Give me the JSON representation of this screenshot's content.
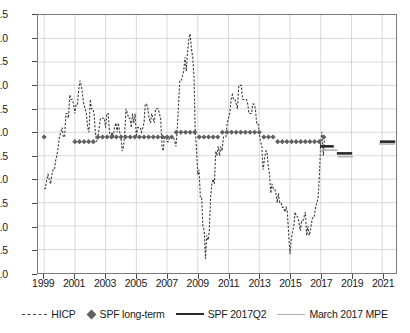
{
  "chart_data": {
    "type": "line",
    "title": "",
    "xlabel": "",
    "ylabel": "",
    "xlim": [
      1998.6,
      2021.9
    ],
    "ylim": [
      -1.0,
      4.5
    ],
    "grid": true,
    "legend_position": "bottom",
    "ytick_labels": [
      "4.5",
      "4.0",
      "3.5",
      "3.0",
      "2.5",
      "2.0",
      "1.5",
      "1.0",
      "0.5",
      "0.0",
      "-0.5",
      "-1.0"
    ],
    "ytick_values": [
      4.5,
      4.0,
      3.5,
      3.0,
      2.5,
      2.0,
      1.5,
      1.0,
      0.5,
      0.0,
      -0.5,
      -1.0
    ],
    "xtick_labels": [
      "1999",
      "2001",
      "2003",
      "2005",
      "2007",
      "2009",
      "2011",
      "2013",
      "2015",
      "2017",
      "2019",
      "2021"
    ],
    "xtick_values": [
      1999,
      2001,
      2003,
      2005,
      2007,
      2009,
      2011,
      2013,
      2015,
      2017,
      2019,
      2021
    ],
    "series": [
      {
        "name": "HICP",
        "style": "dashed-line",
        "color": "#3c3c3c",
        "x": [
          1999.0,
          1999.08,
          1999.17,
          1999.25,
          1999.33,
          1999.42,
          1999.5,
          1999.58,
          1999.67,
          1999.75,
          1999.83,
          1999.92,
          2000.0,
          2000.08,
          2000.17,
          2000.25,
          2000.33,
          2000.42,
          2000.5,
          2000.58,
          2000.67,
          2000.75,
          2000.83,
          2000.92,
          2001.0,
          2001.08,
          2001.17,
          2001.25,
          2001.33,
          2001.42,
          2001.5,
          2001.58,
          2001.67,
          2001.75,
          2001.83,
          2001.92,
          2002.0,
          2002.08,
          2002.17,
          2002.25,
          2002.33,
          2002.42,
          2002.5,
          2002.58,
          2002.67,
          2002.75,
          2002.83,
          2002.92,
          2003.0,
          2003.08,
          2003.17,
          2003.25,
          2003.33,
          2003.42,
          2003.5,
          2003.58,
          2003.67,
          2003.75,
          2003.83,
          2003.92,
          2004.0,
          2004.08,
          2004.17,
          2004.25,
          2004.33,
          2004.42,
          2004.5,
          2004.58,
          2004.67,
          2004.75,
          2004.83,
          2004.92,
          2005.0,
          2005.08,
          2005.17,
          2005.25,
          2005.33,
          2005.42,
          2005.5,
          2005.58,
          2005.67,
          2005.75,
          2005.83,
          2005.92,
          2006.0,
          2006.08,
          2006.17,
          2006.25,
          2006.33,
          2006.42,
          2006.5,
          2006.58,
          2006.67,
          2006.75,
          2006.83,
          2006.92,
          2007.0,
          2007.08,
          2007.17,
          2007.25,
          2007.33,
          2007.42,
          2007.5,
          2007.58,
          2007.67,
          2007.75,
          2007.83,
          2007.92,
          2008.0,
          2008.08,
          2008.17,
          2008.25,
          2008.33,
          2008.42,
          2008.5,
          2008.58,
          2008.67,
          2008.75,
          2008.83,
          2008.92,
          2009.0,
          2009.08,
          2009.17,
          2009.25,
          2009.33,
          2009.42,
          2009.5,
          2009.58,
          2009.67,
          2009.75,
          2009.83,
          2009.92,
          2010.0,
          2010.08,
          2010.17,
          2010.25,
          2010.33,
          2010.42,
          2010.5,
          2010.58,
          2010.67,
          2010.75,
          2010.83,
          2010.92,
          2011.0,
          2011.08,
          2011.17,
          2011.25,
          2011.33,
          2011.42,
          2011.5,
          2011.58,
          2011.67,
          2011.75,
          2011.83,
          2011.92,
          2012.0,
          2012.08,
          2012.17,
          2012.25,
          2012.33,
          2012.42,
          2012.5,
          2012.58,
          2012.67,
          2012.75,
          2012.83,
          2012.92,
          2013.0,
          2013.08,
          2013.17,
          2013.25,
          2013.33,
          2013.42,
          2013.5,
          2013.58,
          2013.67,
          2013.75,
          2013.83,
          2013.92,
          2014.0,
          2014.08,
          2014.17,
          2014.25,
          2014.33,
          2014.42,
          2014.5,
          2014.58,
          2014.67,
          2014.75,
          2014.83,
          2014.92,
          2015.0,
          2015.08,
          2015.17,
          2015.25,
          2015.33,
          2015.42,
          2015.5,
          2015.58,
          2015.67,
          2015.75,
          2015.83,
          2015.92,
          2016.0,
          2016.08,
          2016.17,
          2016.25,
          2016.33,
          2016.42,
          2016.5,
          2016.58,
          2016.67,
          2016.75,
          2016.83,
          2016.92,
          2017.0,
          2017.08,
          2017.17,
          2017.25
        ],
        "y": [
          0.8,
          0.8,
          1.0,
          1.1,
          1.0,
          0.9,
          1.1,
          1.2,
          1.2,
          1.4,
          1.5,
          1.7,
          1.9,
          2.0,
          2.1,
          1.9,
          1.9,
          2.4,
          2.4,
          2.3,
          2.8,
          2.7,
          2.7,
          2.6,
          2.4,
          2.6,
          2.6,
          2.9,
          3.1,
          3.0,
          2.8,
          2.6,
          2.5,
          2.4,
          2.1,
          2.0,
          2.7,
          2.5,
          2.5,
          2.4,
          2.0,
          1.8,
          1.9,
          2.1,
          2.3,
          2.3,
          2.3,
          2.3,
          2.1,
          2.4,
          2.4,
          2.0,
          1.9,
          2.0,
          1.9,
          2.1,
          2.2,
          2.0,
          2.2,
          2.0,
          1.9,
          1.6,
          1.7,
          2.0,
          2.5,
          2.4,
          2.3,
          2.3,
          2.1,
          2.4,
          2.2,
          2.4,
          1.9,
          2.1,
          2.1,
          2.1,
          2.0,
          2.1,
          2.2,
          2.6,
          2.6,
          2.5,
          2.3,
          2.2,
          2.4,
          2.3,
          2.2,
          2.5,
          2.5,
          2.5,
          2.4,
          2.3,
          1.7,
          1.6,
          1.9,
          1.9,
          1.8,
          1.8,
          1.9,
          1.9,
          1.9,
          1.9,
          1.8,
          1.7,
          2.1,
          2.6,
          3.1,
          3.1,
          3.2,
          3.3,
          3.6,
          3.3,
          3.7,
          4.0,
          4.1,
          3.8,
          3.6,
          3.2,
          2.1,
          1.6,
          1.1,
          1.2,
          0.6,
          0.6,
          0.0,
          -0.1,
          -0.7,
          -0.2,
          -0.3,
          -0.1,
          0.6,
          0.9,
          1.0,
          0.9,
          1.6,
          1.5,
          1.7,
          1.5,
          1.7,
          1.6,
          1.9,
          1.9,
          1.9,
          2.2,
          2.3,
          2.4,
          2.7,
          2.8,
          2.7,
          2.7,
          2.6,
          2.5,
          3.0,
          3.0,
          3.0,
          2.7,
          2.7,
          2.7,
          2.7,
          2.6,
          2.4,
          2.4,
          2.4,
          2.6,
          2.6,
          2.5,
          2.2,
          2.2,
          2.0,
          1.8,
          1.7,
          1.2,
          1.4,
          1.6,
          1.6,
          1.3,
          1.1,
          0.7,
          0.9,
          0.8,
          0.8,
          0.7,
          0.5,
          0.7,
          0.5,
          0.5,
          0.4,
          0.4,
          0.3,
          0.4,
          0.3,
          -0.2,
          -0.6,
          -0.3,
          -0.1,
          0.0,
          0.3,
          0.2,
          0.2,
          0.1,
          -0.1,
          0.1,
          0.1,
          0.2,
          0.3,
          -0.2,
          0.0,
          -0.2,
          -0.1,
          0.1,
          0.2,
          0.2,
          0.4,
          0.5,
          0.6,
          1.1,
          1.8,
          2.0,
          1.5,
          1.9
        ]
      },
      {
        "name": "SPF long-term",
        "style": "diamond-markers",
        "color": "#5f5f5f",
        "x": [
          1999.0,
          2001.0,
          2001.3,
          2001.6,
          2001.9,
          2002.2,
          2002.5,
          2002.8,
          2003.1,
          2003.4,
          2003.7,
          2004.0,
          2004.3,
          2004.6,
          2004.9,
          2005.2,
          2005.5,
          2005.8,
          2006.1,
          2006.4,
          2006.7,
          2007.0,
          2007.3,
          2007.6,
          2007.9,
          2008.2,
          2008.5,
          2008.8,
          2009.1,
          2009.4,
          2009.7,
          2010.0,
          2010.3,
          2010.6,
          2010.9,
          2011.2,
          2011.5,
          2011.8,
          2012.1,
          2012.4,
          2012.7,
          2013.0,
          2013.3,
          2013.6,
          2013.9,
          2014.2,
          2014.5,
          2014.8,
          2015.1,
          2015.4,
          2015.7,
          2016.0,
          2016.3,
          2016.6,
          2016.9,
          2017.2
        ],
        "y": [
          1.9,
          1.8,
          1.8,
          1.8,
          1.8,
          1.8,
          1.9,
          1.9,
          1.9,
          1.9,
          1.9,
          1.9,
          1.9,
          1.9,
          1.9,
          1.9,
          1.9,
          1.9,
          1.9,
          1.9,
          1.9,
          1.9,
          1.9,
          2.0,
          2.0,
          2.0,
          2.0,
          2.0,
          1.9,
          1.9,
          1.9,
          1.9,
          1.9,
          2.0,
          2.0,
          2.0,
          2.0,
          2.0,
          2.0,
          2.0,
          2.0,
          2.0,
          1.9,
          1.9,
          1.9,
          1.8,
          1.8,
          1.8,
          1.8,
          1.8,
          1.8,
          1.8,
          1.8,
          1.8,
          1.8,
          1.9
        ]
      },
      {
        "name": "SPF 2017Q2",
        "style": "solid-line-dark",
        "color": "#2a2a2a",
        "segments": [
          {
            "x0": 2016.95,
            "x1": 2017.85,
            "y": 1.7
          },
          {
            "x0": 2018.05,
            "x1": 2019.05,
            "y": 1.55
          },
          {
            "x0": 2020.85,
            "x1": 2021.85,
            "y": 1.8
          }
        ]
      },
      {
        "name": "March 2017 MPE",
        "style": "solid-line-light",
        "color": "#b2b2b2",
        "segments": [
          {
            "x0": 2016.95,
            "x1": 2018.1,
            "y": 1.62
          },
          {
            "x0": 2018.1,
            "x1": 2019.1,
            "y": 1.48
          },
          {
            "x0": 2020.8,
            "x1": 2021.85,
            "y": 1.75
          }
        ]
      }
    ]
  },
  "legend": {
    "items": [
      {
        "label": "HICP",
        "swatch": "dashed-line-swatch"
      },
      {
        "label": "SPF long-term",
        "swatch": "diamond-marker-swatch"
      },
      {
        "label": "SPF 2017Q2",
        "swatch": "solid-dark-line-swatch"
      },
      {
        "label": "March 2017 MPE",
        "swatch": "solid-light-line-swatch"
      }
    ]
  }
}
